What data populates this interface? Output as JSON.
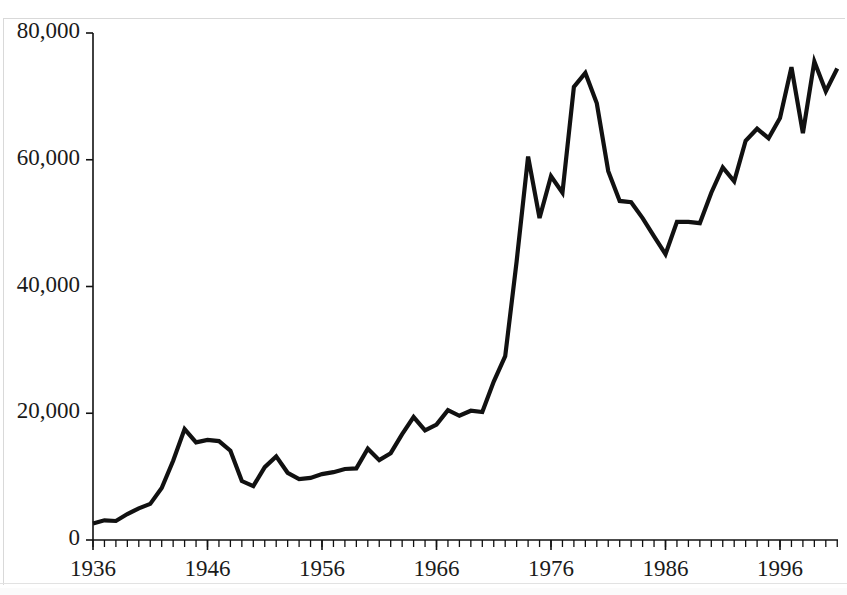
{
  "chart_data": {
    "type": "line",
    "title": "",
    "subtitle": "",
    "xlabel": "",
    "ylabel": "",
    "xlim": [
      1936,
      2001
    ],
    "ylim": [
      0,
      80000
    ],
    "grid": false,
    "legend": null,
    "series_color": "#111111",
    "line_width": 4,
    "y_ticks": [
      0,
      20000,
      40000,
      60000,
      80000
    ],
    "y_tick_labels": [
      "0",
      "20,000",
      "40,000",
      "60,000",
      "80,000"
    ],
    "x_ticks": [
      1936,
      1946,
      1956,
      1966,
      1976,
      1986,
      1996
    ],
    "x_tick_labels": [
      "1936",
      "1946",
      "1956",
      "1966",
      "1976",
      "1986",
      "1996"
    ],
    "x_minor_tick_interval": 1,
    "x": [
      1936,
      1937,
      1938,
      1939,
      1940,
      1941,
      1942,
      1943,
      1944,
      1945,
      1946,
      1947,
      1948,
      1949,
      1950,
      1951,
      1952,
      1953,
      1954,
      1955,
      1956,
      1957,
      1958,
      1959,
      1960,
      1961,
      1962,
      1963,
      1964,
      1965,
      1966,
      1967,
      1968,
      1969,
      1970,
      1971,
      1972,
      1973,
      1974,
      1975,
      1976,
      1977,
      1978,
      1979,
      1980,
      1981,
      1982,
      1983,
      1984,
      1985,
      1986,
      1987,
      1988,
      1989,
      1990,
      1991,
      1992,
      1993,
      1994,
      1995,
      1996,
      1997,
      1998,
      1999,
      2000,
      2001
    ],
    "values": [
      2600,
      3100,
      3000,
      4100,
      5000,
      5700,
      8200,
      12500,
      17500,
      15400,
      15800,
      15600,
      14100,
      9300,
      8500,
      11500,
      13200,
      10600,
      9600,
      9800,
      10400,
      10700,
      11200,
      11300,
      14400,
      12600,
      13700,
      16700,
      19400,
      17300,
      18200,
      20500,
      19600,
      20400,
      20200,
      25000,
      29000,
      44000,
      60500,
      50800,
      57400,
      54800,
      71500,
      73700,
      68900,
      58200,
      53500,
      53300,
      50800,
      47900,
      45100,
      50200,
      50200,
      50000,
      54800,
      58800,
      56600,
      63000,
      64900,
      63400,
      66600,
      74600,
      64200,
      75500,
      70800,
      74400
    ]
  },
  "axis": {
    "y_labels": [
      "80,000",
      "60,000",
      "40,000",
      "20,000",
      "0"
    ],
    "x_labels": [
      "1936",
      "1946",
      "1956",
      "1966",
      "1976",
      "1986",
      "1996"
    ]
  }
}
